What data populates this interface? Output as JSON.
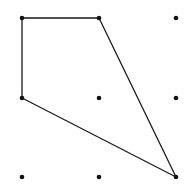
{
  "diagram": {
    "title": "",
    "colors": {
      "background": "#ffffff",
      "stroke": "#1a1a1a",
      "dot": "#111111"
    },
    "grid": {
      "columns_x": [
        22,
        99,
        176
      ],
      "rows_y": [
        18,
        98,
        177
      ],
      "dot_radius": 2.3
    },
    "dots": [
      {
        "col": 0,
        "row": 0
      },
      {
        "col": 1,
        "row": 0
      },
      {
        "col": 2,
        "row": 0
      },
      {
        "col": 0,
        "row": 1
      },
      {
        "col": 1,
        "row": 1
      },
      {
        "col": 2,
        "row": 1
      },
      {
        "col": 0,
        "row": 2
      },
      {
        "col": 1,
        "row": 2
      },
      {
        "col": 2,
        "row": 2
      }
    ],
    "polygon": {
      "vertices": [
        {
          "col": 0,
          "row": 0
        },
        {
          "col": 1,
          "row": 0
        },
        {
          "col": 2,
          "row": 2
        },
        {
          "col": 0,
          "row": 1
        }
      ],
      "stroke_width": 1.3
    }
  }
}
